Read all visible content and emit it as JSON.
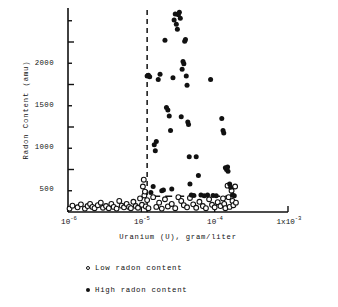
{
  "chart_data": {
    "type": "scatter",
    "title": "",
    "xlabel": "Uranium (U), gram/liter",
    "ylabel": "Radon Content (amu)",
    "xscale": "log",
    "xlim": [
      1e-06,
      0.001
    ],
    "ylim": [
      0,
      2400
    ],
    "grid": false,
    "legend_position": "below-plot",
    "y_ticks_major": [
      500,
      1000,
      1500,
      2000
    ],
    "y_tick_labels": [
      "500",
      "1000",
      "1500",
      "2000"
    ],
    "y_minor_tick_interval": 250,
    "x_ticks": [
      1e-06,
      1e-05,
      0.0001,
      0.001
    ],
    "x_tick_labels": [
      "10⁻⁶",
      "10⁻⁵",
      "10⁻⁴",
      "1x10⁻³"
    ],
    "x_tick_mantissa": [
      "10",
      "10",
      "10",
      "1x10"
    ],
    "x_tick_exponent": [
      "-6",
      "-5",
      "-4",
      "-3"
    ],
    "annotations": [
      {
        "name": "vertical-threshold-line",
        "type": "vline",
        "x": 1.2e-05,
        "style": "dashed"
      },
      {
        "name": "horizontal-threshold-line",
        "type": "hline",
        "y": 185,
        "x_start": 1.45e-05,
        "x_end": 0.00019,
        "style": "dashed"
      }
    ],
    "series": [
      {
        "name": "Low radon content",
        "marker": "open-circle",
        "color": "#111111",
        "points": [
          [
            1.05e-06,
            40
          ],
          [
            1.15e-06,
            75
          ],
          [
            1.35e-06,
            55
          ],
          [
            1.5e-06,
            90
          ],
          [
            1.7e-06,
            40
          ],
          [
            1.85e-06,
            70
          ],
          [
            2e-06,
            95
          ],
          [
            2.15e-06,
            60
          ],
          [
            2.3e-06,
            45
          ],
          [
            2.55e-06,
            80
          ],
          [
            2.8e-06,
            110
          ],
          [
            3e-06,
            50
          ],
          [
            3.3e-06,
            70
          ],
          [
            3.6e-06,
            45
          ],
          [
            3.9e-06,
            95
          ],
          [
            4.2e-06,
            60
          ],
          [
            4.6e-06,
            40
          ],
          [
            5e-06,
            130
          ],
          [
            5.4e-06,
            75
          ],
          [
            5.8e-06,
            55
          ],
          [
            6.3e-06,
            95
          ],
          [
            6.8e-06,
            60
          ],
          [
            7.2e-06,
            45
          ],
          [
            7.8e-06,
            120
          ],
          [
            8.4e-06,
            70
          ],
          [
            9e-06,
            50
          ],
          [
            9.6e-06,
            160
          ],
          [
            1.02e-05,
            85
          ],
          [
            1.05e-05,
            300
          ],
          [
            1.08e-05,
            380
          ],
          [
            1.1e-05,
            195
          ],
          [
            1.12e-05,
            240
          ],
          [
            1.15e-05,
            65
          ],
          [
            1.2e-05,
            140
          ],
          [
            1.25e-05,
            45
          ],
          [
            1.45e-05,
            175
          ],
          [
            1.6e-05,
            60
          ],
          [
            1.75e-05,
            110
          ],
          [
            1.9e-05,
            40
          ],
          [
            2.1e-05,
            150
          ],
          [
            2.3e-05,
            65
          ],
          [
            2.6e-05,
            95
          ],
          [
            2.9e-05,
            45
          ],
          [
            3.2e-05,
            175
          ],
          [
            3.5e-05,
            130
          ],
          [
            3.8e-05,
            80
          ],
          [
            4.2e-05,
            55
          ],
          [
            4.6e-05,
            165
          ],
          [
            5.1e-05,
            90
          ],
          [
            5.6e-05,
            50
          ],
          [
            6.2e-05,
            120
          ],
          [
            6.9e-05,
            70
          ],
          [
            7.6e-05,
            45
          ],
          [
            8.4e-05,
            150
          ],
          [
            9.2e-05,
            85
          ],
          [
            0.0001,
            55
          ],
          [
            0.00011,
            115
          ],
          [
            0.00012,
            70
          ],
          [
            0.00013,
            160
          ],
          [
            0.000135,
            95
          ],
          [
            0.00014,
            45
          ],
          [
            0.00015,
            310
          ],
          [
            0.000155,
            175
          ],
          [
            0.00016,
            60
          ],
          [
            0.00017,
            250
          ],
          [
            0.000175,
            130
          ],
          [
            0.00018,
            80
          ],
          [
            0.00019,
            300
          ],
          [
            0.000195,
            110
          ]
        ]
      },
      {
        "name": "High radon content",
        "marker": "filled-circle",
        "color": "#111111",
        "points": [
          [
            1.2e-05,
            1600
          ],
          [
            1.25e-05,
            1610
          ],
          [
            1.3e-05,
            1590
          ],
          [
            1.35e-05,
            230
          ],
          [
            1.45e-05,
            300
          ],
          [
            1.5e-05,
            790
          ],
          [
            1.55e-05,
            720
          ],
          [
            1.6e-05,
            830
          ],
          [
            1.7e-05,
            1560
          ],
          [
            1.8e-05,
            1620
          ],
          [
            1.9e-05,
            250
          ],
          [
            2e-05,
            260
          ],
          [
            2.1e-05,
            2020
          ],
          [
            2.2e-05,
            1230
          ],
          [
            2.3e-05,
            1200
          ],
          [
            2.4e-05,
            1130
          ],
          [
            2.5e-05,
            960
          ],
          [
            2.6e-05,
            270
          ],
          [
            2.7e-05,
            1580
          ],
          [
            2.8e-05,
            2260
          ],
          [
            2.9e-05,
            2330
          ],
          [
            3e-05,
            2210
          ],
          [
            3.1e-05,
            2150
          ],
          [
            3.2e-05,
            2320
          ],
          [
            3.3e-05,
            2350
          ],
          [
            3.4e-05,
            2280
          ],
          [
            3.5e-05,
            1120
          ],
          [
            3.6e-05,
            1680
          ],
          [
            3.7e-05,
            1770
          ],
          [
            3.8e-05,
            1745
          ],
          [
            3.9e-05,
            2010
          ],
          [
            4e-05,
            2030
          ],
          [
            4.1e-05,
            1600
          ],
          [
            4.2e-05,
            1490
          ],
          [
            4.3e-05,
            1060
          ],
          [
            4.4e-05,
            1030
          ],
          [
            4.5e-05,
            650
          ],
          [
            4.6e-05,
            330
          ],
          [
            4.8e-05,
            200
          ],
          [
            5.2e-05,
            195
          ],
          [
            5.6e-05,
            650
          ],
          [
            6e-05,
            430
          ],
          [
            6.5e-05,
            200
          ],
          [
            7.2e-05,
            190
          ],
          [
            8e-05,
            200
          ],
          [
            8.8e-05,
            1560
          ],
          [
            9.5e-05,
            195
          ],
          [
            0.000105,
            190
          ],
          [
            0.000125,
            1100
          ],
          [
            0.00013,
            960
          ],
          [
            0.000133,
            930
          ],
          [
            0.00014,
            520
          ],
          [
            0.000145,
            500
          ],
          [
            0.00015,
            530
          ],
          [
            0.000152,
            480
          ],
          [
            0.00016,
            330
          ],
          [
            0.000165,
            290
          ],
          [
            0.000175,
            200
          ],
          [
            0.000185,
            190
          ]
        ]
      }
    ]
  },
  "legend": {
    "entries": [
      {
        "marker": "open-circle",
        "label": "Low radon content"
      },
      {
        "marker": "filled-circle",
        "label": "High radon content"
      }
    ]
  }
}
